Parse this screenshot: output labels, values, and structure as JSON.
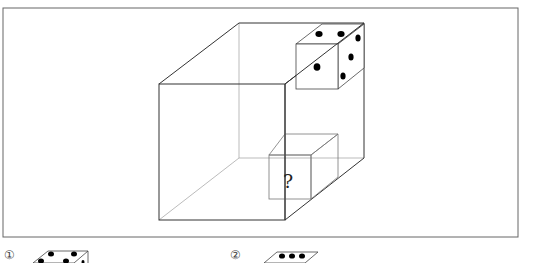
{
  "figure": {
    "question_mark": "?",
    "colors": {
      "line": "#333333",
      "light_line": "#9a9a9a",
      "pip": "#000000",
      "frame": "#555555"
    }
  },
  "options": [
    {
      "label": "①",
      "top_pips": 2,
      "front_pips": 3
    },
    {
      "label": "②",
      "top_pips": 3
    }
  ]
}
